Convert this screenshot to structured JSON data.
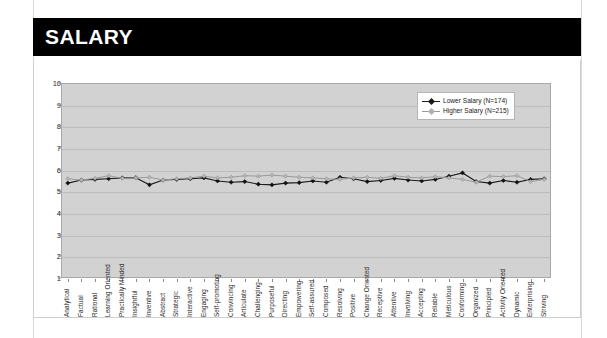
{
  "document": {
    "section_title": "SALARY"
  },
  "chart_data": {
    "type": "line",
    "title": "",
    "xlabel": "",
    "ylabel": "",
    "ylim": [
      1,
      10
    ],
    "yticks": [
      1,
      2,
      3,
      4,
      5,
      6,
      7,
      8,
      9,
      10
    ],
    "grid": true,
    "legend_position": "top-right",
    "categories": [
      "Analytical",
      "Factual",
      "Rational",
      "Learning Oriented",
      "Practically Minded",
      "Insightful",
      "Inventive",
      "Abstract",
      "Strategic",
      "Interactive",
      "Engaging",
      "Self-promoting",
      "Convincing",
      "Articulate",
      "Challenging",
      "Purposeful",
      "Directing",
      "Empowering",
      "Self-assured",
      "Composed",
      "Resolving",
      "Positive",
      "Change Oriented",
      "Receptive",
      "Attentive",
      "Involving",
      "Accepting",
      "Reliable",
      "Meticulous",
      "Conforming",
      "Organized",
      "Principled",
      "Activity Oriented",
      "Dynamic",
      "Enterprising",
      "Striving"
    ],
    "series": [
      {
        "name": "Lower Salary (N=174)",
        "color": "#1a1a1a",
        "n": 174,
        "values": [
          5.38,
          5.52,
          5.55,
          5.58,
          5.62,
          5.63,
          5.3,
          5.52,
          5.55,
          5.58,
          5.62,
          5.48,
          5.42,
          5.45,
          5.33,
          5.3,
          5.38,
          5.4,
          5.48,
          5.42,
          5.65,
          5.58,
          5.45,
          5.5,
          5.6,
          5.52,
          5.48,
          5.55,
          5.7,
          5.85,
          5.45,
          5.38,
          5.5,
          5.42,
          5.55,
          5.58
        ]
      },
      {
        "name": "Higher Salary (N=215)",
        "color": "#9a9a9a",
        "n": 215,
        "values": [
          5.58,
          5.52,
          5.6,
          5.72,
          5.6,
          5.62,
          5.65,
          5.52,
          5.58,
          5.62,
          5.7,
          5.62,
          5.65,
          5.72,
          5.7,
          5.75,
          5.7,
          5.65,
          5.62,
          5.58,
          5.55,
          5.62,
          5.65,
          5.6,
          5.72,
          5.65,
          5.62,
          5.68,
          5.62,
          5.55,
          5.42,
          5.7,
          5.68,
          5.72,
          5.45,
          5.55
        ]
      }
    ]
  }
}
